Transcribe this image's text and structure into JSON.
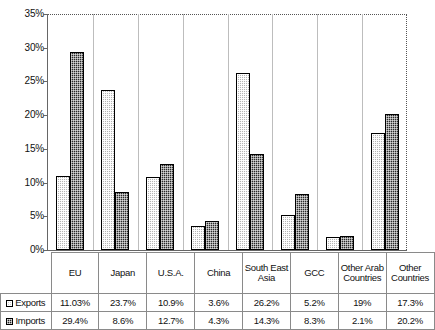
{
  "chart_data": {
    "type": "bar",
    "title": "",
    "xlabel": "",
    "ylabel": "",
    "ylim": [
      0,
      35
    ],
    "ytick_labels": [
      "0%",
      "5%",
      "10%",
      "15%",
      "20%",
      "25%",
      "30%",
      "35%"
    ],
    "ytick_values": [
      0,
      5,
      10,
      15,
      20,
      25,
      30,
      35
    ],
    "grid": false,
    "legend_position": "table-left",
    "categories": [
      "EU",
      "Japan",
      "U.S.A.",
      "China",
      "South East Asia",
      "GCC",
      "Other Arab Countries",
      "Other Countries"
    ],
    "series": [
      {
        "name": "Exports",
        "values": [
          11.03,
          23.7,
          10.9,
          3.6,
          26.2,
          5.2,
          1.9,
          17.3
        ],
        "labels": [
          "11.03%",
          "23.7%",
          "10.9%",
          "3.6%",
          "26.2%",
          "5.2%",
          "19%",
          "17.3%"
        ],
        "color": "#b5b5b5"
      },
      {
        "name": "Imports",
        "values": [
          29.4,
          8.6,
          12.7,
          4.3,
          14.3,
          8.3,
          2.1,
          20.2
        ],
        "labels": [
          "29.4%",
          "8.6%",
          "12.7%",
          "4.3%",
          "14.3%",
          "8.3%",
          "2.1%",
          "20.2%"
        ],
        "color": "#2a2a2a"
      }
    ]
  },
  "table": {
    "corner_label": "",
    "row_labels": [
      "Exports",
      "Imports"
    ]
  }
}
